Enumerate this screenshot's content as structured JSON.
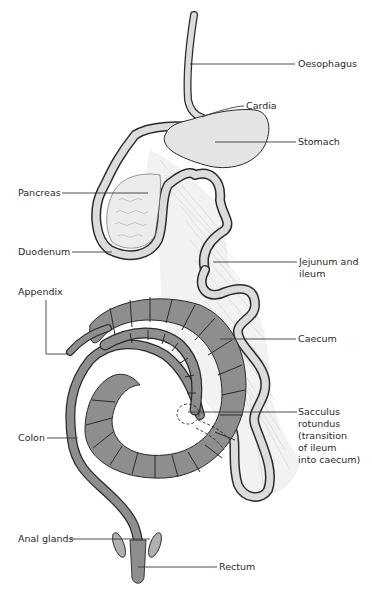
{
  "diagram": {
    "colors": {
      "light_tissue": "#e4e4e4",
      "dark_tissue": "#8e8e8e",
      "outline": "#2a2a2a",
      "mesentery": "#f2f2f2",
      "label_text": "#2a2a2a"
    },
    "labels": {
      "oesophagus": "Oesophagus",
      "cardia": "Cardia",
      "stomach": "Stomach",
      "pancreas": "Pancreas",
      "duodenum": "Duodenum",
      "jejunum": "Jejunum and\nileum",
      "appendix": "Appendix",
      "caecum": "Caecum",
      "sacculus": "Sacculus\nrotundus\n(transition\nof ileum\ninto caecum)",
      "colon": "Colon",
      "anal_glands": "Anal glands",
      "rectum": "Rectum"
    }
  }
}
